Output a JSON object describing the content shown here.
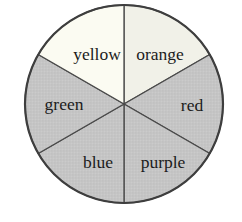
{
  "figure": {
    "background": "#ffffff"
  },
  "chart_data": {
    "type": "pie",
    "title": "",
    "labels": [
      "orange",
      "red",
      "purple",
      "blue",
      "green",
      "yellow"
    ],
    "values": [
      1,
      1,
      1,
      1,
      1,
      1
    ],
    "fractions_note": "six equal sixths, boundaries at vertical diameter and two 60-degree diagonals",
    "geometry": {
      "cx": 124,
      "cy": 104,
      "r": 99
    },
    "colors": {
      "light_yellow": "#fbfbf2",
      "light_orange": "#f1f1e8",
      "gray_base": "#c6c6c6",
      "gray_dot_dark": "#b9b9b9",
      "gray_dot_light": "#d3d3d3",
      "outline": "#3e3e3e",
      "divider": "#4a4a4a",
      "text": "#1c1c1c"
    },
    "slices": [
      {
        "label": "orange",
        "start_deg": 0,
        "end_deg": 60,
        "shade": "light",
        "fill": "#f1f1e8",
        "label_x": 160,
        "label_y": 60
      },
      {
        "label": "red",
        "start_deg": 60,
        "end_deg": 120,
        "shade": "gray",
        "fill": "pattern",
        "label_x": 192,
        "label_y": 111
      },
      {
        "label": "purple",
        "start_deg": 120,
        "end_deg": 180,
        "shade": "gray",
        "fill": "pattern",
        "label_x": 163,
        "label_y": 168
      },
      {
        "label": "blue",
        "start_deg": 180,
        "end_deg": 240,
        "shade": "gray",
        "fill": "pattern",
        "label_x": 98,
        "label_y": 168
      },
      {
        "label": "green",
        "start_deg": 240,
        "end_deg": 300,
        "shade": "gray",
        "fill": "pattern",
        "label_x": 64,
        "label_y": 110
      },
      {
        "label": "yellow",
        "start_deg": 300,
        "end_deg": 360,
        "shade": "light",
        "fill": "#fbfbf2",
        "label_x": 97,
        "label_y": 60
      }
    ]
  }
}
